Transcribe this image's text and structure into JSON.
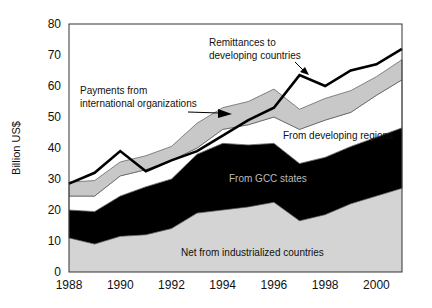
{
  "chart_data": {
    "type": "area",
    "title": "",
    "xlabel": "",
    "ylabel": "Billion US$",
    "ylim": [
      0,
      80
    ],
    "xlim": [
      1988,
      2001
    ],
    "yticks": [
      "0",
      "10",
      "20",
      "30",
      "40",
      "50",
      "60",
      "70",
      "80"
    ],
    "xticks": [
      "1988",
      "1990",
      "1992",
      "1994",
      "1996",
      "1998",
      "2000"
    ],
    "grid": false,
    "legend": "inline annotations",
    "x": [
      1988,
      1989,
      1990,
      1991,
      1992,
      1993,
      1994,
      1995,
      1996,
      1997,
      1998,
      1999,
      2000,
      2001
    ],
    "stacked_series": [
      {
        "name": "Net from industrialized countries",
        "color": "#d4d4d4",
        "cumulative": [
          11,
          9,
          11.5,
          12,
          14,
          19,
          20,
          21,
          22.5,
          16.5,
          18.5,
          22,
          24.5,
          27
        ]
      },
      {
        "name": "From GCC states",
        "color": "#000000",
        "cumulative": [
          20,
          19.5,
          24.5,
          27.5,
          30,
          38,
          41.5,
          41,
          41.5,
          35,
          37,
          40.5,
          43.5,
          46.5
        ]
      },
      {
        "name": "From developing regions",
        "color": "#ffffff",
        "cumulative": [
          24.5,
          24.5,
          31,
          33,
          36,
          40,
          46,
          47.5,
          50,
          46,
          49,
          51.5,
          57,
          62
        ]
      },
      {
        "name": "Payments from international organizations",
        "color": "#c8c8c8",
        "cumulative": [
          29,
          29.5,
          35.5,
          37.5,
          40.5,
          48,
          53,
          55,
          59,
          52.5,
          56,
          58.5,
          63,
          68.5
        ]
      }
    ],
    "line_series": [
      {
        "name": "Remittances to developing countries",
        "color": "#000000",
        "values": [
          28.5,
          32,
          39,
          32.5,
          36,
          39,
          44,
          49,
          53,
          63.5,
          60,
          65,
          67,
          72
        ]
      }
    ],
    "annotations": [
      {
        "text_lines": [
          "Remittances to",
          "developing countries"
        ]
      },
      {
        "text_lines": [
          "Payments from",
          "international organizations"
        ]
      },
      {
        "text_lines": [
          "From developing regions"
        ]
      },
      {
        "text_lines": [
          "From GCC states"
        ]
      },
      {
        "text_lines": [
          "Net from industrialized countries"
        ]
      }
    ]
  }
}
